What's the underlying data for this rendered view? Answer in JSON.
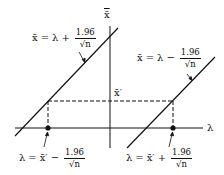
{
  "diagram": {
    "axes": {
      "x_label": "λ",
      "y_label": "x̄"
    },
    "marked_value": "x̄′",
    "lines": {
      "upper": {
        "lhs": "x̄",
        "eq": "=",
        "rhs": "λ",
        "op": "+",
        "num": "1.96",
        "den": "√n"
      },
      "lower": {
        "lhs": "x̄",
        "eq": "=",
        "rhs": "λ",
        "op": "−",
        "num": "1.96",
        "den": "√n"
      }
    },
    "interval_bounds": {
      "left": {
        "lhs": "λ",
        "eq": "=",
        "rhs": "x̄′",
        "op": "−",
        "num": "1.96",
        "den": "√n"
      },
      "right": {
        "lhs": "λ",
        "eq": "=",
        "rhs": "x̄′",
        "op": "+",
        "num": "1.96",
        "den": "√n"
      }
    },
    "colors": {
      "stroke": "#111111",
      "background": "#ffffff"
    }
  }
}
